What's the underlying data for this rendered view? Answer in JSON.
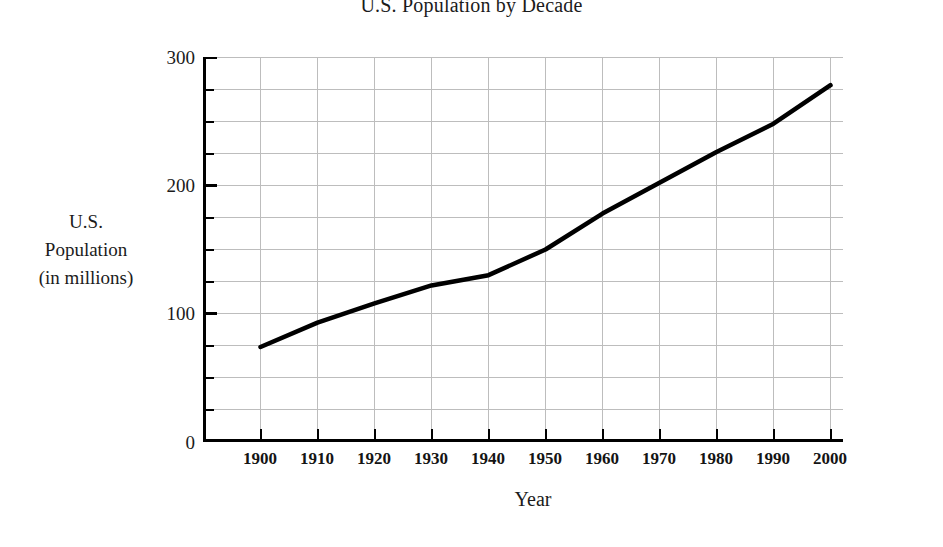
{
  "chart_data": {
    "type": "line",
    "title": "U.S. Population by Decade",
    "xlabel": "Year",
    "ylabel": "U.S. Population (in millions)",
    "ylabel_lines": [
      "U.S.",
      "Population",
      "(in millions)"
    ],
    "categories": [
      1900,
      1910,
      1920,
      1930,
      1940,
      1950,
      1960,
      1970,
      1980,
      1990,
      2000
    ],
    "x_tick_labels": [
      "1900",
      "1910",
      "1920",
      "1930",
      "1940",
      "1950",
      "1960",
      "1970",
      "1980",
      "1990",
      "2000"
    ],
    "values": [
      74,
      93,
      108,
      122,
      130,
      150,
      178,
      202,
      226,
      248,
      278
    ],
    "series": [
      {
        "name": "U.S. Population",
        "values": [
          74,
          93,
          108,
          122,
          130,
          150,
          178,
          202,
          226,
          248,
          278
        ]
      }
    ],
    "y_tick_labels": [
      "0",
      "100",
      "200",
      "300"
    ],
    "y_major_ticks": [
      0,
      100,
      200,
      300
    ],
    "y_minor_tick_interval": 25,
    "xlim": [
      1900,
      2000
    ],
    "ylim": [
      0,
      300
    ],
    "grid": true,
    "grid_color": "#b9b9b9",
    "legend": "none",
    "line_color": "#000000",
    "axis_color": "#000000",
    "background": "#ffffff"
  }
}
